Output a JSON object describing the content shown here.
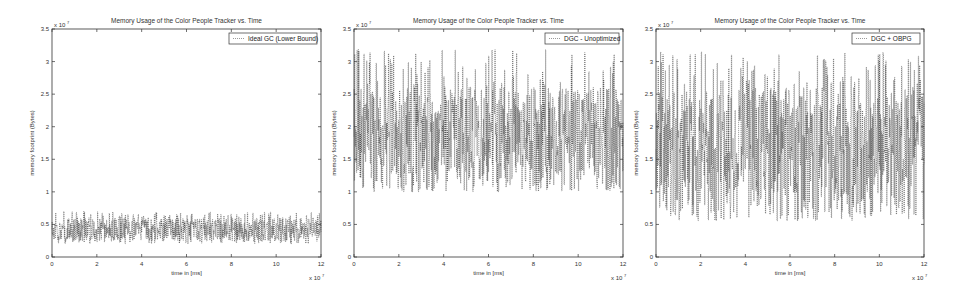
{
  "chart_data": [
    {
      "type": "line",
      "title": "Memory Usage of the Color People Tracker vs. Time",
      "xlabel": "time in [ms]",
      "ylabel": "memory footprint (Bytes)",
      "x_multiplier": "x 10^7",
      "y_multiplier": "x 10^7",
      "xlim": [
        0,
        12
      ],
      "ylim": [
        0,
        3.5
      ],
      "xticks": [
        "0",
        "2",
        "4",
        "6",
        "8",
        "10",
        "12"
      ],
      "yticks": [
        "0",
        "0.5",
        "1",
        "1.5",
        "2",
        "2.5",
        "3",
        "3.5"
      ],
      "legend": {
        "position": "upper right",
        "entries": [
          "Ideal GC (Lower Bound)"
        ]
      },
      "grid": false,
      "series": [
        {
          "name": "Ideal GC (Lower Bound)",
          "style": "dotted",
          "min": 0.2,
          "typical_low": 0.25,
          "typical_high": 0.6,
          "peak": 0.7
        }
      ]
    },
    {
      "type": "line",
      "title": "Memory Usage of the Color People Tracker vs. Time",
      "xlabel": "time in [ms]",
      "ylabel": "memory footprint (Bytes)",
      "x_multiplier": "x 10^7",
      "y_multiplier": "x 10^7",
      "xlim": [
        0,
        12
      ],
      "ylim": [
        0,
        3.5
      ],
      "xticks": [
        "0",
        "2",
        "4",
        "6",
        "8",
        "10",
        "12"
      ],
      "yticks": [
        "0",
        "0.5",
        "1",
        "1.5",
        "2",
        "2.5",
        "3",
        "3.5"
      ],
      "legend": {
        "position": "upper right",
        "entries": [
          "DGC - Unoptimized"
        ]
      },
      "grid": false,
      "series": [
        {
          "name": "DGC - Unoptimized",
          "style": "dotted",
          "min": 1.0,
          "typical_low": 1.1,
          "typical_high": 2.6,
          "peak": 3.2
        }
      ]
    },
    {
      "type": "line",
      "title": "Memory Usage of the Color People Tracker vs. Time",
      "xlabel": "time in [ms]",
      "ylabel": "memory footprint (Bytes)",
      "x_multiplier": "x 10^7",
      "y_multiplier": "x 10^7",
      "xlim": [
        0,
        12
      ],
      "ylim": [
        0,
        3.5
      ],
      "xticks": [
        "0",
        "2",
        "4",
        "6",
        "8",
        "10",
        "12"
      ],
      "yticks": [
        "0",
        "0.5",
        "1",
        "1.5",
        "2",
        "2.5",
        "3",
        "3.5"
      ],
      "legend": {
        "position": "upper right",
        "entries": [
          "DGC + OBPG"
        ]
      },
      "grid": false,
      "series": [
        {
          "name": "DGC + OBPG",
          "style": "dotted",
          "min": 0.55,
          "typical_low": 0.7,
          "typical_high": 2.6,
          "peak": 3.15
        }
      ]
    }
  ],
  "charts": [
    {
      "title": "Memory Usage of the Color People Tracker vs. Time",
      "legend": "Ideal GC (Lower Bound)",
      "xlabel": "time in [ms]",
      "ylabel": "memory footprint (Bytes)",
      "xexp": "x 10",
      "yexp": "x 10",
      "exp": "7"
    },
    {
      "title": "Memory Usage of the Color People Tracker vs. Time",
      "legend": "DGC - Unoptimized",
      "xlabel": "time in [ms]",
      "ylabel": "memory footprint (Bytes)",
      "xexp": "x 10",
      "yexp": "x 10",
      "exp": "7"
    },
    {
      "title": "Memory Usage of the Color People Tracker vs. Time",
      "legend": "DGC + OBPG",
      "xlabel": "time in [ms]",
      "ylabel": "memory footprint (Bytes)",
      "xexp": "x 10",
      "yexp": "x 10",
      "exp": "7"
    }
  ]
}
